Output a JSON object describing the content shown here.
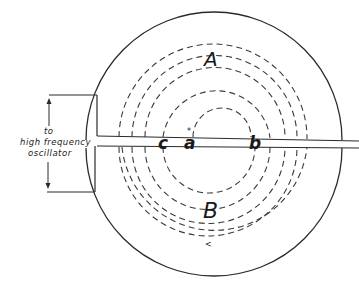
{
  "diagram": {
    "type": "cyclotron-dees-schematic",
    "colors": {
      "ink": "#1a1a1a",
      "background": "#ffffff"
    },
    "labels": {
      "dee_upper": "A",
      "dee_lower": "B",
      "point_c": "c",
      "point_a": "a",
      "point_b": "b",
      "oscillator_line1": "to",
      "oscillator_line2": "high frequency",
      "oscillator_line3": "oscillator",
      "direction_arrow": "<"
    }
  }
}
